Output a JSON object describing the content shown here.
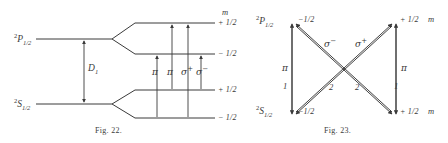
{
  "page": {
    "background": "#ffffff",
    "ink": "#3a3a3a"
  },
  "figures": [
    {
      "id": "fig-22",
      "caption": "Fig. 22.",
      "kind": "zeeman-level-splitting-diagram",
      "terms": [
        {
          "name": "upper-term",
          "presuperscript": "2",
          "letter": "P",
          "subscript": "1/2"
        },
        {
          "name": "lower-term",
          "presuperscript": "2",
          "letter": "S",
          "subscript": "1/2"
        }
      ],
      "column_header": "m",
      "sublevels": [
        {
          "name": "upper-plus",
          "label": "+ 1/2"
        },
        {
          "name": "upper-minus",
          "label": "− 1/2"
        },
        {
          "name": "lower-plus",
          "label": "+ 1/2"
        },
        {
          "name": "lower-minus",
          "label": "− 1/2"
        }
      ],
      "interval_label": {
        "letter": "D",
        "subscript": "1"
      },
      "transitions": [
        {
          "name": "transition-pi-1",
          "label": "π",
          "superscript": ""
        },
        {
          "name": "transition-pi-2",
          "label": "π",
          "superscript": ""
        },
        {
          "name": "transition-sigma-plus",
          "label": "σ",
          "superscript": "+"
        },
        {
          "name": "transition-sigma-minus",
          "label": "σ",
          "superscript": "−"
        }
      ]
    },
    {
      "id": "fig-23",
      "caption": "Fig. 23.",
      "kind": "transition-intensity-scheme",
      "terms": [
        {
          "name": "upper-term",
          "presuperscript": "2",
          "letter": "P",
          "subscript": "1/2"
        },
        {
          "name": "lower-term",
          "presuperscript": "2",
          "letter": "S",
          "subscript": "1/2"
        }
      ],
      "column_header": "m",
      "sublevels": [
        {
          "name": "upper-left-m",
          "label": "−1/2"
        },
        {
          "name": "upper-right-m",
          "label": "+ 1/2"
        },
        {
          "name": "lower-left-m",
          "label": "−1/2"
        },
        {
          "name": "lower-right-m",
          "label": "+ 1/2"
        }
      ],
      "transition_labels": [
        {
          "name": "pi-left",
          "label": "π",
          "superscript": ""
        },
        {
          "name": "pi-right",
          "label": "π",
          "superscript": ""
        },
        {
          "name": "sigma-minus",
          "label": "σ",
          "superscript": "−"
        },
        {
          "name": "sigma-plus",
          "label": "σ",
          "superscript": "+"
        }
      ],
      "intensities": [
        {
          "name": "intensity-pi-left",
          "value": "1"
        },
        {
          "name": "intensity-sigma-minus",
          "value": "2"
        },
        {
          "name": "intensity-sigma-plus",
          "value": "2"
        },
        {
          "name": "intensity-pi-right",
          "value": "1"
        }
      ]
    }
  ]
}
